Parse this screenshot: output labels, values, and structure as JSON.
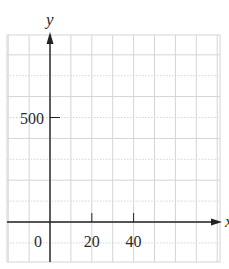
{
  "chart_data": {
    "type": "line",
    "title": "",
    "xlabel": "x",
    "ylabel": "y",
    "x_ticks": [
      0,
      20,
      40
    ],
    "y_ticks": [
      500
    ],
    "x_tick_labels": [
      "0",
      "20",
      "40"
    ],
    "y_tick_labels": [
      "500"
    ],
    "xlim": [
      -20,
      80
    ],
    "ylim": [
      -200,
      900
    ],
    "grid": true,
    "grid_step_x": 10,
    "grid_step_y": 100,
    "series": [],
    "note": "Blank coordinate grid with labeled axes; no data plotted"
  },
  "colors": {
    "grid": "#d4d4d4",
    "axis": "#222222",
    "text": "#2a2a2a"
  }
}
